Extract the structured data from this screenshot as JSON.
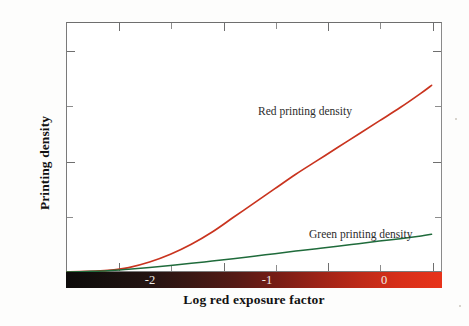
{
  "chart_data": {
    "type": "line",
    "title": "",
    "xlabel": "Log red exposure factor",
    "ylabel": "Printing density",
    "xlim": [
      -2.5,
      1.1
    ],
    "ylim": [
      0,
      2.25
    ],
    "xticks": [
      -2,
      -1,
      0,
      1
    ],
    "xtick_labels": [
      "-2",
      "-1",
      "0",
      "1"
    ],
    "xminor_ticks": [
      -2.5,
      -1.5,
      -0.5,
      0.5
    ],
    "yticks": [
      0,
      1,
      2
    ],
    "ytick_labels": [
      "0",
      "1",
      "2"
    ],
    "yminor_ticks": [
      0.5,
      1.5
    ],
    "grid": false,
    "legend_position": "inline-annotations",
    "x_axis_colorbar": {
      "description": "red exposure gradient strip under x axis",
      "from_color": "#0d0b0a",
      "to_color": "#e8331a"
    },
    "series": [
      {
        "name": "Red printing density",
        "color": "#c9341f",
        "annotation": "Red printing density",
        "x": [
          -2.5,
          -2.3,
          -2.1,
          -1.9,
          -1.7,
          -1.5,
          -1.3,
          -1.1,
          -0.9,
          -0.7,
          -0.5,
          -0.3,
          -0.1,
          0.1,
          0.3,
          0.5,
          0.7,
          0.9,
          1.0
        ],
        "y": [
          0.0,
          0.005,
          0.015,
          0.04,
          0.09,
          0.16,
          0.25,
          0.36,
          0.49,
          0.62,
          0.75,
          0.88,
          1.0,
          1.12,
          1.24,
          1.36,
          1.48,
          1.61,
          1.68
        ]
      },
      {
        "name": "Green printing density",
        "color": "#1f6b3b",
        "annotation": "Green printing density",
        "x": [
          -2.5,
          -2.3,
          -2.1,
          -1.9,
          -1.7,
          -1.5,
          -1.3,
          -1.1,
          -0.9,
          -0.7,
          -0.5,
          -0.3,
          -0.1,
          0.1,
          0.3,
          0.5,
          0.7,
          0.9,
          1.0
        ],
        "y": [
          0.0,
          0.005,
          0.012,
          0.025,
          0.04,
          0.058,
          0.078,
          0.098,
          0.12,
          0.142,
          0.165,
          0.188,
          0.21,
          0.232,
          0.255,
          0.278,
          0.3,
          0.325,
          0.34
        ]
      }
    ]
  },
  "axis": {
    "ylabel_text": "Printing density",
    "xlabel_text": "Log red exposure factor",
    "ytick_0": "0",
    "ytick_1": "1",
    "ytick_2": "2",
    "xtick_m2": "-2",
    "xtick_m1": "-1",
    "xtick_0": "0",
    "xtick_1": "1"
  },
  "annotations": {
    "red": "Red printing density",
    "green": "Green printing density"
  },
  "colors": {
    "red_curve": "#c9341f",
    "green_curve": "#1f6b3b",
    "frame": "#7a7a7a",
    "gradient_start": "#0d0b0a",
    "gradient_end": "#e8331a"
  }
}
